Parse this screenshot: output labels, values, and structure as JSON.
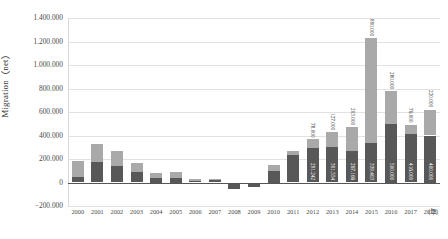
{
  "chart_data": {
    "type": "bar",
    "title": "",
    "subtitle": "",
    "stacked": true,
    "xlabel": "（年）",
    "ylabel": "Migration（net）",
    "ylim": [
      -200000,
      1400000
    ],
    "ytick_labels": [
      "1.400.000",
      "1.200.000",
      "1.000.000",
      "800.000",
      "600.000",
      "400.000",
      "200.000",
      "0",
      "−200.000"
    ],
    "ytick_values": [
      1400000,
      1200000,
      1000000,
      800000,
      600000,
      400000,
      200000,
      0,
      -200000
    ],
    "grid": true,
    "legend": "none",
    "categories": [
      "2000",
      "2001",
      "2002",
      "2003",
      "2004",
      "2005",
      "2006",
      "2007",
      "2008",
      "2009",
      "2010",
      "2011",
      "2012",
      "2013",
      "2014",
      "2015",
      "2016",
      "2017",
      "2018"
    ],
    "series": [
      {
        "name": "lower-segment",
        "color": "#585858",
        "values": [
          44000,
          172000,
          144000,
          92000,
          38000,
          38000,
          16000,
          22000,
          -56000,
          -42000,
          98000,
          232000,
          291242,
          301554,
          267166,
          339403,
          500000,
          416000,
          400000
        ],
        "labels": [
          "",
          "",
          "",
          "",
          "",
          "",
          "",
          "",
          "",
          "",
          "",
          "",
          "291.242",
          "301.554",
          "267.166",
          "339.403",
          "500.000",
          "416.000",
          "400.000"
        ]
      },
      {
        "name": "upper-segment",
        "color": "#a9a9a9",
        "values": [
          136000,
          152000,
          126000,
          74000,
          46000,
          48000,
          12000,
          12000,
          0,
          0,
          50000,
          40000,
          78000,
          127000,
          203000,
          890000,
          280000,
          76000,
          220000
        ],
        "labels": [
          "",
          "",
          "",
          "",
          "",
          "",
          "",
          "",
          "",
          "",
          "",
          "",
          "78.000",
          "127.000",
          "203.000",
          "890.000",
          "280.000",
          "76.000",
          "220.000"
        ]
      }
    ],
    "totals": [
      180000,
      324000,
      270000,
      166000,
      84000,
      86000,
      28000,
      34000,
      -56000,
      -42000,
      148000,
      272000,
      369242,
      428554,
      470166,
      1229403,
      780000,
      492000,
      620000
    ]
  }
}
